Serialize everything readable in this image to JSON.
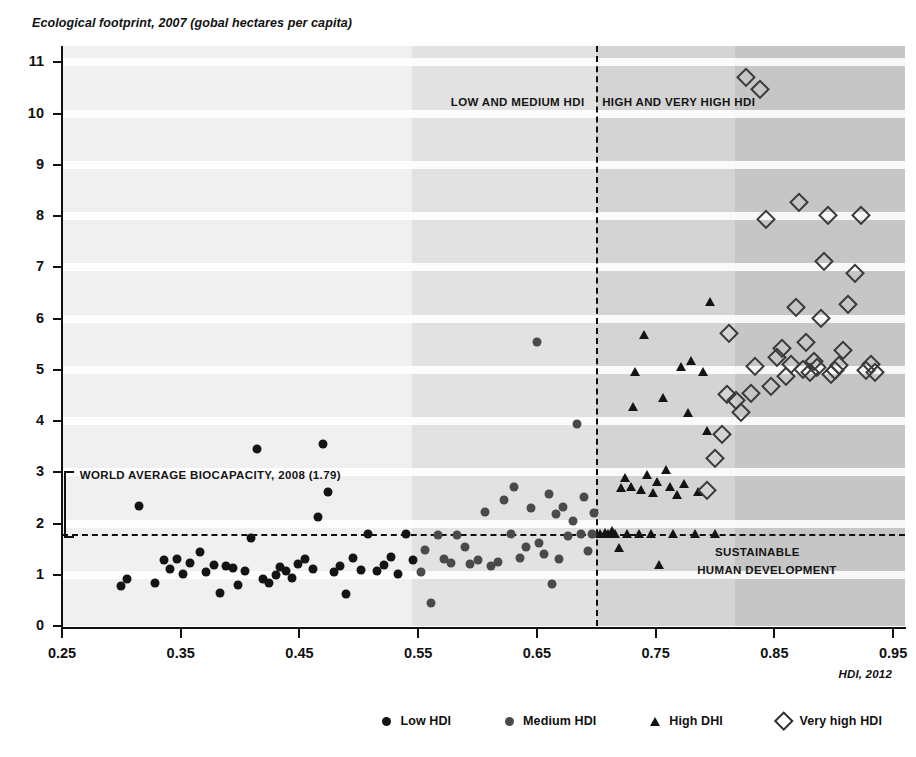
{
  "chart_data": {
    "type": "scatter",
    "title": "Ecological footprint, 2007 (gobal hectares per capita)",
    "ylabel": "Ecological footprint, 2007 (gobal hectares per capita)",
    "xlabel": "HDI, 2012",
    "xlim": [
      0.25,
      0.96
    ],
    "ylim": [
      0,
      11.3
    ],
    "grid": "horizontal-bands",
    "legend_position": "bottom-right",
    "x_ticks": [
      "0.25",
      "0.35",
      "0.45",
      "0.55",
      "0.65",
      "0.75",
      "0.85",
      "0.95"
    ],
    "x_tick_values": [
      0.25,
      0.35,
      0.45,
      0.55,
      0.65,
      0.75,
      0.85,
      0.95
    ],
    "y_ticks": [
      "0",
      "1",
      "2",
      "3",
      "4",
      "5",
      "6",
      "7",
      "8",
      "9",
      "10",
      "11"
    ],
    "y_tick_values": [
      0,
      1,
      2,
      3,
      4,
      5,
      6,
      7,
      8,
      9,
      10,
      11
    ],
    "reference_lines": [
      {
        "name": "world-average-biocapacity",
        "orientation": "horizontal",
        "value": 1.79,
        "style": "dashed",
        "label": "WORLD AVERAGE BIOCAPACITY, 2008 (1.79)"
      },
      {
        "name": "hdi-threshold",
        "orientation": "vertical",
        "value": 0.7,
        "style": "dashed",
        "label": ""
      }
    ],
    "annotations": [
      {
        "name": "low-medium-hdi-zone",
        "text": "LOW AND MEDIUM HDI",
        "x": 0.69,
        "y": 10.2,
        "align": "right"
      },
      {
        "name": "high-very-high-hdi-zone",
        "text": "HIGH AND VERY HIGH HDI",
        "x": 0.705,
        "y": 10.2,
        "align": "left"
      },
      {
        "name": "biocapacity-annotation",
        "text": "WORLD AVERAGE BIOCAPACITY, 2008 (1.79)",
        "x": 0.265,
        "y": 2.92,
        "align": "left"
      },
      {
        "name": "sustainable-quadrant-line1",
        "text": "SUSTAINABLE",
        "x": 0.8,
        "y": 1.42,
        "align": "left"
      },
      {
        "name": "sustainable-quadrant-line2",
        "text": "HUMAN DEVELOPMENT",
        "x": 0.785,
        "y": 1.08,
        "align": "left"
      }
    ],
    "shaded_zones": [
      {
        "name": "zone-lightest",
        "x_start": 0.25,
        "x_end": 0.545,
        "color": "#f0f0f0"
      },
      {
        "name": "zone-light",
        "x_start": 0.545,
        "x_end": 0.7,
        "color": "#e2e2e2"
      },
      {
        "name": "zone-medium",
        "x_start": 0.7,
        "x_end": 0.817,
        "color": "#d4d4d4"
      },
      {
        "name": "zone-dark",
        "x_start": 0.817,
        "x_end": 0.96,
        "color": "#c6c6c6"
      }
    ],
    "series": [
      {
        "name": "Low HDI",
        "marker": "filled-circle",
        "color": "#141414",
        "points": [
          [
            0.3,
            0.78
          ],
          [
            0.305,
            0.92
          ],
          [
            0.315,
            2.35
          ],
          [
            0.328,
            0.83
          ],
          [
            0.336,
            1.28
          ],
          [
            0.341,
            1.12
          ],
          [
            0.347,
            1.3
          ],
          [
            0.352,
            1.02
          ],
          [
            0.358,
            1.22
          ],
          [
            0.366,
            1.45
          ],
          [
            0.371,
            1.05
          ],
          [
            0.378,
            1.2
          ],
          [
            0.383,
            0.64
          ],
          [
            0.388,
            1.18
          ],
          [
            0.394,
            1.14
          ],
          [
            0.398,
            0.8
          ],
          [
            0.404,
            1.08
          ],
          [
            0.409,
            1.72
          ],
          [
            0.414,
            3.45
          ],
          [
            0.419,
            0.92
          ],
          [
            0.424,
            0.83
          ],
          [
            0.43,
            1.0
          ],
          [
            0.434,
            1.15
          ],
          [
            0.439,
            1.07
          ],
          [
            0.444,
            0.93
          ],
          [
            0.449,
            1.21
          ],
          [
            0.455,
            1.3
          ],
          [
            0.461,
            1.12
          ],
          [
            0.466,
            2.12
          ],
          [
            0.47,
            3.55
          ],
          [
            0.474,
            2.62
          ],
          [
            0.479,
            1.06
          ],
          [
            0.484,
            1.18
          ],
          [
            0.489,
            0.62
          ],
          [
            0.495,
            1.32
          ],
          [
            0.502,
            1.1
          ],
          [
            0.508,
            1.79
          ],
          [
            0.515,
            1.08
          ],
          [
            0.521,
            1.2
          ],
          [
            0.527,
            1.35
          ],
          [
            0.533,
            1.02
          ],
          [
            0.54,
            1.79
          ],
          [
            0.546,
            1.28
          ]
        ]
      },
      {
        "name": "Medium HDI",
        "marker": "filled-circle-gray",
        "color": "#4a4a4a",
        "points": [
          [
            0.552,
            1.05
          ],
          [
            0.556,
            1.48
          ],
          [
            0.561,
            0.45
          ],
          [
            0.567,
            1.78
          ],
          [
            0.572,
            1.3
          ],
          [
            0.578,
            1.22
          ],
          [
            0.583,
            1.78
          ],
          [
            0.589,
            1.55
          ],
          [
            0.594,
            1.21
          ],
          [
            0.6,
            1.28
          ],
          [
            0.606,
            2.22
          ],
          [
            0.611,
            1.18
          ],
          [
            0.617,
            1.25
          ],
          [
            0.622,
            2.45
          ],
          [
            0.628,
            1.79
          ],
          [
            0.631,
            2.72
          ],
          [
            0.636,
            1.32
          ],
          [
            0.641,
            1.54
          ],
          [
            0.645,
            2.3
          ],
          [
            0.65,
            5.55
          ],
          [
            0.652,
            1.62
          ],
          [
            0.656,
            1.4
          ],
          [
            0.66,
            2.58
          ],
          [
            0.663,
            0.82
          ],
          [
            0.666,
            2.18
          ],
          [
            0.669,
            1.31
          ],
          [
            0.672,
            2.32
          ],
          [
            0.676,
            1.75
          ],
          [
            0.68,
            2.05
          ],
          [
            0.684,
            3.95
          ],
          [
            0.687,
            1.79
          ],
          [
            0.69,
            2.52
          ],
          [
            0.693,
            1.46
          ],
          [
            0.696,
            1.79
          ],
          [
            0.698,
            2.2
          ]
        ]
      },
      {
        "name": "High DHI",
        "marker": "filled-triangle",
        "color": "#141414",
        "points": [
          [
            0.703,
            1.79
          ],
          [
            0.707,
            1.82
          ],
          [
            0.71,
            1.79
          ],
          [
            0.713,
            1.85
          ],
          [
            0.716,
            1.79
          ],
          [
            0.719,
            1.52
          ],
          [
            0.721,
            2.7
          ],
          [
            0.724,
            2.88
          ],
          [
            0.726,
            1.79
          ],
          [
            0.729,
            2.72
          ],
          [
            0.731,
            4.28
          ],
          [
            0.733,
            4.95
          ],
          [
            0.736,
            1.79
          ],
          [
            0.738,
            2.65
          ],
          [
            0.74,
            5.68
          ],
          [
            0.743,
            2.95
          ],
          [
            0.746,
            1.79
          ],
          [
            0.748,
            2.6
          ],
          [
            0.751,
            2.82
          ],
          [
            0.753,
            1.2
          ],
          [
            0.756,
            4.45
          ],
          [
            0.759,
            3.05
          ],
          [
            0.762,
            2.72
          ],
          [
            0.765,
            1.79
          ],
          [
            0.768,
            2.55
          ],
          [
            0.771,
            5.05
          ],
          [
            0.774,
            2.78
          ],
          [
            0.777,
            4.15
          ],
          [
            0.78,
            5.18
          ],
          [
            0.783,
            1.79
          ],
          [
            0.786,
            2.62
          ],
          [
            0.79,
            4.96
          ],
          [
            0.793,
            3.8
          ],
          [
            0.796,
            6.32
          ],
          [
            0.8,
            1.79
          ]
        ]
      },
      {
        "name": "Very high HDI",
        "marker": "open-diamond",
        "color": "#3a3a3a",
        "points": [
          [
            0.793,
            2.65
          ],
          [
            0.8,
            3.28
          ],
          [
            0.806,
            3.75
          ],
          [
            0.81,
            4.52
          ],
          [
            0.812,
            5.72
          ],
          [
            0.818,
            4.42
          ],
          [
            0.822,
            4.18
          ],
          [
            0.826,
            10.72
          ],
          [
            0.83,
            4.55
          ],
          [
            0.834,
            5.08
          ],
          [
            0.838,
            10.48
          ],
          [
            0.843,
            7.95
          ],
          [
            0.847,
            4.68
          ],
          [
            0.852,
            5.25
          ],
          [
            0.856,
            5.42
          ],
          [
            0.86,
            4.88
          ],
          [
            0.864,
            5.12
          ],
          [
            0.868,
            6.22
          ],
          [
            0.871,
            8.28
          ],
          [
            0.874,
            5.02
          ],
          [
            0.877,
            5.55
          ],
          [
            0.88,
            4.95
          ],
          [
            0.883,
            5.18
          ],
          [
            0.886,
            5.05
          ],
          [
            0.889,
            6.02
          ],
          [
            0.892,
            7.12
          ],
          [
            0.895,
            8.02
          ],
          [
            0.898,
            4.92
          ],
          [
            0.901,
            5.0
          ],
          [
            0.904,
            5.1
          ],
          [
            0.908,
            5.38
          ],
          [
            0.912,
            6.28
          ],
          [
            0.918,
            6.88
          ],
          [
            0.923,
            8.02
          ],
          [
            0.927,
            5.0
          ],
          [
            0.931,
            5.12
          ],
          [
            0.935,
            4.95
          ]
        ]
      }
    ]
  },
  "legend": {
    "items": [
      {
        "label": "Low HDI",
        "marker": "low"
      },
      {
        "label": "Medium HDI",
        "marker": "medium"
      },
      {
        "label": "High DHI",
        "marker": "high"
      },
      {
        "label": "Very high HDI",
        "marker": "veryhigh"
      }
    ]
  }
}
